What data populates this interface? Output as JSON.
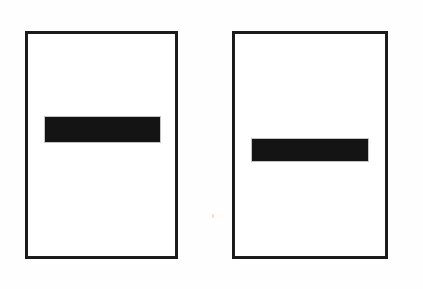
{
  "figure": {
    "background_color": "#fefefe",
    "ink_color": "#1a1a1a",
    "bar_color": "#141414",
    "canvas": {
      "width": 423,
      "height": 289
    },
    "stray_mark": {
      "glyph": "ı",
      "x": 212,
      "y": 212
    }
  },
  "panels": [
    {
      "name": "left-panel",
      "label": "",
      "frame": {
        "x": 25,
        "y": 31,
        "width": 153,
        "height": 228,
        "border_width": 3
      },
      "bar": {
        "name": "left-panel-bar",
        "x": 45,
        "y": 117,
        "width": 115,
        "height": 25,
        "offset_from_frame_left": 20,
        "offset_from_frame_top": 86,
        "vertical_position_label": "upper-middle"
      }
    },
    {
      "name": "right-panel",
      "label": "",
      "frame": {
        "x": 232,
        "y": 31,
        "width": 156,
        "height": 228,
        "border_width": 3
      },
      "bar": {
        "name": "right-panel-bar",
        "x": 252,
        "y": 139,
        "width": 116,
        "height": 22,
        "offset_from_frame_left": 20,
        "offset_from_frame_top": 108,
        "vertical_position_label": "center"
      }
    }
  ]
}
